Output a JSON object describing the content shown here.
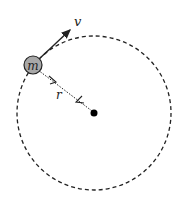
{
  "diagram": {
    "mass_label": "m",
    "velocity_label": "v",
    "radius_label": "r",
    "colors": {
      "stroke": "#222222",
      "mass_fill": "#a8a8a8",
      "center": "#000000",
      "background": "#ffffff"
    },
    "elements": [
      {
        "name": "orbit",
        "type": "dashed-circle",
        "center": [
          94,
          113
        ],
        "radius": 77
      },
      {
        "name": "mass",
        "type": "circle",
        "center": [
          33,
          65
        ],
        "radius": 9,
        "label": "m"
      },
      {
        "name": "velocity-vector",
        "type": "arrow",
        "from": [
          33,
          65
        ],
        "to": [
          72,
          28
        ],
        "label": "v"
      },
      {
        "name": "radius-line",
        "type": "dotted-line",
        "from": [
          33,
          65
        ],
        "to": [
          94,
          113
        ],
        "label": "r"
      },
      {
        "name": "center-point",
        "type": "dot",
        "center": [
          94,
          113
        ]
      }
    ]
  }
}
